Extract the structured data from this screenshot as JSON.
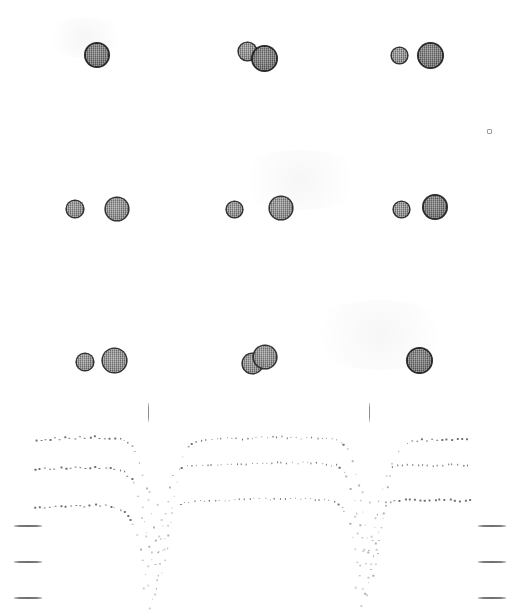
{
  "figure": {
    "kind": "scanned-autoradiograph-contour-figure",
    "width": 526,
    "height": 616,
    "background_color": "#ffffff",
    "ink_color": "#2b2b2b",
    "contour_dot_color": "#6e6e7a",
    "tick_color": "#7e7e7e",
    "caption": "",
    "title": ""
  },
  "spot_rows": [
    {
      "row_label": "row-1",
      "y": 55,
      "groups": [
        {
          "group_label": "group-1-left",
          "spots": [
            {
              "label": "spot-1a",
              "cx": 97,
              "cy": 55,
              "r": 11,
              "density": "dense"
            }
          ]
        },
        {
          "group_label": "group-1-middle",
          "spots": [
            {
              "label": "spot-1b",
              "cx": 247,
              "cy": 51,
              "r": 8.5,
              "density": "normal"
            },
            {
              "label": "spot-1c",
              "cx": 264,
              "cy": 58,
              "r": 11.5,
              "density": "dense"
            }
          ]
        },
        {
          "group_label": "group-1-right",
          "spots": [
            {
              "label": "spot-1d",
              "cx": 399,
              "cy": 55,
              "r": 7.5,
              "density": "normal"
            },
            {
              "label": "spot-1e",
              "cx": 430,
              "cy": 55,
              "r": 11.5,
              "density": "dense"
            }
          ]
        }
      ]
    },
    {
      "row_label": "row-2",
      "y": 209,
      "groups": [
        {
          "group_label": "group-2-left",
          "spots": [
            {
              "label": "spot-2a",
              "cx": 75,
              "cy": 209,
              "r": 8,
              "density": "normal"
            },
            {
              "label": "spot-2b",
              "cx": 117,
              "cy": 209,
              "r": 11,
              "density": "normal"
            }
          ]
        },
        {
          "group_label": "group-2-middle",
          "spots": [
            {
              "label": "spot-2c",
              "cx": 234,
              "cy": 209,
              "r": 7.5,
              "density": "normal"
            },
            {
              "label": "spot-2d",
              "cx": 281,
              "cy": 208,
              "r": 11,
              "density": "normal"
            }
          ]
        },
        {
          "group_label": "group-2-right",
          "spots": [
            {
              "label": "spot-2e",
              "cx": 401,
              "cy": 209,
              "r": 7.5,
              "density": "normal"
            },
            {
              "label": "spot-2f",
              "cx": 435,
              "cy": 207,
              "r": 11,
              "density": "dense"
            }
          ]
        }
      ]
    },
    {
      "row_label": "row-3",
      "y": 361,
      "groups": [
        {
          "group_label": "group-3-left",
          "spots": [
            {
              "label": "spot-3a",
              "cx": 85,
              "cy": 362,
              "r": 8,
              "density": "normal"
            },
            {
              "label": "spot-3b",
              "cx": 114,
              "cy": 360,
              "r": 11.5,
              "density": "normal"
            }
          ]
        },
        {
          "group_label": "group-3-middle",
          "spots": [
            {
              "label": "spot-3c",
              "cx": 252,
              "cy": 363,
              "r": 9.5,
              "density": "normal"
            },
            {
              "label": "spot-3d",
              "cx": 265,
              "cy": 357,
              "r": 11,
              "density": "normal"
            }
          ]
        },
        {
          "group_label": "group-3-right",
          "spots": [
            {
              "label": "spot-3e",
              "cx": 419,
              "cy": 360,
              "r": 11.5,
              "density": "dense"
            }
          ]
        }
      ]
    }
  ],
  "speck": {
    "label": "stray-speck",
    "cx": 488,
    "cy": 130,
    "size": 3
  },
  "vertical_ticks": [
    {
      "label": "vtick-left",
      "x": 148,
      "y_top": 403,
      "height": 19
    },
    {
      "label": "vtick-right",
      "x": 369,
      "y_top": 403,
      "height": 19
    }
  ],
  "margin_dashes": {
    "left": [
      {
        "label": "left-dash-1",
        "x": 14,
        "y": 525,
        "width": 28
      },
      {
        "label": "left-dash-2",
        "x": 14,
        "y": 561,
        "width": 28
      },
      {
        "label": "left-dash-3",
        "x": 14,
        "y": 597,
        "width": 28
      }
    ],
    "right": [
      {
        "label": "right-dash-1",
        "x": 478,
        "y": 525,
        "width": 28
      },
      {
        "label": "right-dash-2",
        "x": 478,
        "y": 561,
        "width": 28
      },
      {
        "label": "right-dash-3",
        "x": 478,
        "y": 597,
        "width": 28
      }
    ]
  },
  "chart_data": {
    "type": "line",
    "title": "",
    "xlabel": "",
    "ylabel": "",
    "grid": false,
    "legend": "none",
    "xlim": [
      0,
      526
    ],
    "ylim": [
      616,
      0
    ],
    "render_style": "dotted",
    "dot_spacing_px": 5,
    "series": [
      {
        "name": "contour-upper",
        "baseline_y": 441,
        "points": [
          [
            36,
            441
          ],
          [
            64,
            439
          ],
          [
            92,
            438
          ],
          [
            116,
            439
          ],
          [
            128,
            442
          ],
          [
            136,
            451
          ],
          [
            141,
            466
          ],
          [
            146,
            484
          ],
          [
            150,
            502
          ],
          [
            154,
            521
          ],
          [
            157,
            540
          ],
          [
            160,
            559
          ],
          [
            162,
            576
          ],
          [
            166,
            556
          ],
          [
            170,
            534
          ],
          [
            173,
            512
          ],
          [
            176,
            492
          ],
          [
            179,
            474
          ],
          [
            182,
            460
          ],
          [
            186,
            450
          ],
          [
            193,
            444
          ],
          [
            206,
            441
          ],
          [
            240,
            439
          ],
          [
            280,
            438
          ],
          [
            320,
            439
          ],
          [
            340,
            441
          ],
          [
            348,
            449
          ],
          [
            354,
            464
          ],
          [
            359,
            483
          ],
          [
            363,
            503
          ],
          [
            366,
            523
          ],
          [
            369,
            543
          ],
          [
            371,
            562
          ],
          [
            373,
            578
          ],
          [
            377,
            558
          ],
          [
            381,
            536
          ],
          [
            384,
            514
          ],
          [
            387,
            494
          ],
          [
            390,
            476
          ],
          [
            394,
            461
          ],
          [
            399,
            451
          ],
          [
            407,
            444
          ],
          [
            420,
            441
          ],
          [
            446,
            440
          ],
          [
            470,
            440
          ]
        ]
      },
      {
        "name": "contour-middle",
        "baseline_y": 470,
        "points": [
          [
            36,
            470
          ],
          [
            64,
            469
          ],
          [
            92,
            468
          ],
          [
            114,
            469
          ],
          [
            126,
            473
          ],
          [
            134,
            482
          ],
          [
            139,
            497
          ],
          [
            144,
            514
          ],
          [
            148,
            532
          ],
          [
            152,
            551
          ],
          [
            155,
            569
          ],
          [
            160,
            550
          ],
          [
            164,
            529
          ],
          [
            167,
            508
          ],
          [
            170,
            489
          ],
          [
            174,
            476
          ],
          [
            179,
            469
          ],
          [
            190,
            466
          ],
          [
            206,
            465
          ],
          [
            240,
            464
          ],
          [
            280,
            463
          ],
          [
            320,
            464
          ],
          [
            338,
            466
          ],
          [
            346,
            474
          ],
          [
            352,
            489
          ],
          [
            357,
            507
          ],
          [
            361,
            527
          ],
          [
            364,
            547
          ],
          [
            367,
            566
          ],
          [
            372,
            547
          ],
          [
            376,
            526
          ],
          [
            379,
            505
          ],
          [
            383,
            487
          ],
          [
            387,
            474
          ],
          [
            393,
            468
          ],
          [
            404,
            466
          ],
          [
            420,
            466
          ],
          [
            446,
            466
          ],
          [
            470,
            466
          ]
        ]
      },
      {
        "name": "contour-lower",
        "baseline_y": 508,
        "points": [
          [
            36,
            508
          ],
          [
            64,
            507
          ],
          [
            92,
            506
          ],
          [
            112,
            507
          ],
          [
            124,
            511
          ],
          [
            132,
            521
          ],
          [
            137,
            536
          ],
          [
            142,
            553
          ],
          [
            146,
            571
          ],
          [
            150,
            589
          ],
          [
            154,
            601
          ],
          [
            158,
            584
          ],
          [
            162,
            563
          ],
          [
            165,
            542
          ],
          [
            169,
            523
          ],
          [
            173,
            511
          ],
          [
            179,
            505
          ],
          [
            192,
            502
          ],
          [
            210,
            501
          ],
          [
            244,
            500
          ],
          [
            282,
            499
          ],
          [
            320,
            500
          ],
          [
            336,
            502
          ],
          [
            344,
            510
          ],
          [
            350,
            525
          ],
          [
            355,
            543
          ],
          [
            359,
            563
          ],
          [
            362,
            582
          ],
          [
            365,
            598
          ],
          [
            370,
            580
          ],
          [
            374,
            559
          ],
          [
            378,
            538
          ],
          [
            382,
            520
          ],
          [
            386,
            508
          ],
          [
            393,
            503
          ],
          [
            406,
            501
          ],
          [
            422,
            501
          ],
          [
            448,
            501
          ],
          [
            472,
            501
          ]
        ]
      }
    ],
    "scatter_noise": [
      [
        151,
        493
      ],
      [
        158,
        505
      ],
      [
        143,
        519
      ],
      [
        163,
        520
      ],
      [
        147,
        536
      ],
      [
        160,
        538
      ],
      [
        152,
        552
      ],
      [
        166,
        551
      ],
      [
        149,
        567
      ],
      [
        157,
        580
      ],
      [
        144,
        589
      ],
      [
        155,
        596
      ],
      [
        150,
        608
      ],
      [
        363,
        492
      ],
      [
        370,
        504
      ],
      [
        356,
        518
      ],
      [
        375,
        519
      ],
      [
        359,
        535
      ],
      [
        372,
        537
      ],
      [
        364,
        551
      ],
      [
        378,
        550
      ],
      [
        361,
        566
      ],
      [
        369,
        579
      ],
      [
        356,
        588
      ],
      [
        367,
        595
      ],
      [
        362,
        607
      ]
    ]
  }
}
